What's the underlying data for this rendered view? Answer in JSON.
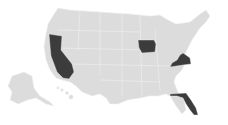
{
  "map": {
    "type": "choropleth",
    "region": "United States",
    "colors": {
      "base": "#dcdcdc",
      "highlight": "#3c3c3c",
      "border": "#f2f2f2",
      "background": "#ffffff"
    },
    "highlighted_states": [
      "California",
      "Iowa",
      "Virginia",
      "Florida"
    ]
  }
}
